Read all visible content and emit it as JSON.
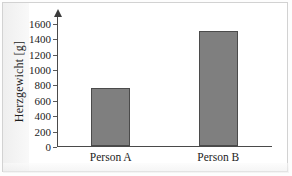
{
  "chart_data": {
    "type": "bar",
    "title": "",
    "xlabel": "",
    "ylabel": "Herzgewicht [g]",
    "categories": [
      "Person A",
      "Person B"
    ],
    "values": [
      750,
      1490
    ],
    "ylim": [
      0,
      1700
    ],
    "yticks": [
      0,
      200,
      400,
      600,
      800,
      1000,
      1200,
      1400,
      1600
    ],
    "ytick_labels": [
      "0",
      "200",
      "400",
      "600",
      "800",
      "1000",
      "1200",
      "1400",
      "1600"
    ],
    "grid": false,
    "legend": null,
    "bar_color": "#7f7f7f",
    "bar_edge_color": "#4b4b4b",
    "axis_color": "#4a4a4a",
    "background_color": "#ffffff",
    "frame_color": "#d2d2d2"
  }
}
